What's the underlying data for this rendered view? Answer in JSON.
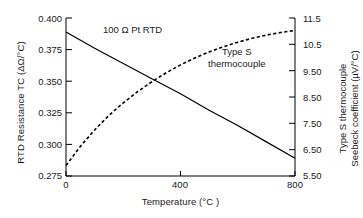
{
  "chart_data": {
    "type": "line",
    "title": "",
    "xlabel": "Temperature (°C )",
    "xlim": [
      0,
      800
    ],
    "xticks": [
      0,
      400,
      800
    ],
    "xtick_labels": [
      "0",
      "400",
      "800"
    ],
    "grid": false,
    "legend": "none",
    "axes": {
      "left": {
        "label": "RTD Resistance TC (ΔΩ/°C)",
        "lim": [
          0.275,
          0.4
        ],
        "ticks": [
          0.275,
          0.3,
          0.325,
          0.35,
          0.375,
          0.4
        ],
        "tick_labels": [
          "0.275",
          "0.300",
          "0.325",
          "0.350",
          "0.375",
          "0.400"
        ]
      },
      "right": {
        "label_line1": "Type S thermocouple",
        "label_line2": "Seebeck coefficient (µV/°C)",
        "lim": [
          5.5,
          11.5
        ],
        "ticks": [
          5.5,
          6.5,
          7.5,
          8.5,
          9.5,
          10.5,
          11.5
        ],
        "tick_labels": [
          "5.50",
          "6.50",
          "7.50",
          "8.50",
          "9.50",
          "10.5",
          "11.5"
        ]
      }
    },
    "series": [
      {
        "name": "100 Ω Pt RTD",
        "axis": "left",
        "style": "solid",
        "color": "#000000",
        "annotation": "100 Ω Pt RTD",
        "x": [
          0,
          100,
          200,
          300,
          400,
          500,
          600,
          700,
          800
        ],
        "values": [
          0.389,
          0.376,
          0.364,
          0.352,
          0.34,
          0.327,
          0.315,
          0.302,
          0.289
        ]
      },
      {
        "name": "Type S thermocouple",
        "axis": "right",
        "style": "dashed",
        "color": "#000000",
        "annotation_line1": "Type S",
        "annotation_line2": "thermocouple",
        "x": [
          0,
          50,
          100,
          150,
          200,
          250,
          300,
          350,
          400,
          450,
          500,
          550,
          600,
          650,
          700,
          750,
          800
        ],
        "values": [
          5.9,
          6.62,
          7.25,
          7.8,
          8.28,
          8.7,
          9.08,
          9.42,
          9.72,
          9.98,
          10.21,
          10.41,
          10.58,
          10.73,
          10.85,
          10.95,
          11.03
        ]
      }
    ]
  },
  "colors": {
    "background": "#ffffff",
    "frame": "#000000",
    "text": "#1a1a1a"
  }
}
